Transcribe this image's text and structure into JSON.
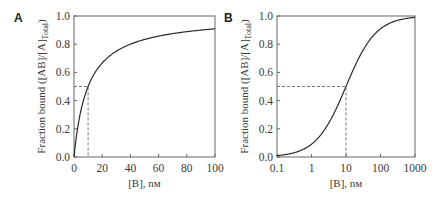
{
  "chart_data": [
    {
      "type": "line",
      "panel": "A",
      "title": "",
      "xlabel": "[B], nм",
      "ylabel": "Fraction bound ([AB]/[A]Total)",
      "xscale": "linear",
      "xlim": [
        0,
        100
      ],
      "ylim": [
        0,
        1.0
      ],
      "x_ticks": [
        "0",
        "20",
        "40",
        "60",
        "80",
        "100"
      ],
      "y_ticks": [
        "0.0",
        "0.2",
        "0.4",
        "0.6",
        "0.8",
        "1.0"
      ],
      "grid": false,
      "legend": null,
      "series": [
        {
          "name": "binding curve",
          "function": "x / (10 + x)",
          "x": [
            0,
            2,
            5,
            10,
            20,
            30,
            40,
            50,
            60,
            70,
            80,
            90,
            100
          ],
          "y": [
            0,
            0.17,
            0.33,
            0.5,
            0.67,
            0.75,
            0.8,
            0.83,
            0.86,
            0.88,
            0.89,
            0.9,
            0.91
          ]
        }
      ],
      "annotations": [
        {
          "type": "dashed-guide",
          "x": 10,
          "y": 0.5,
          "label": "Kd = 10 nM"
        }
      ]
    },
    {
      "type": "line",
      "panel": "B",
      "title": "",
      "xlabel": "[B], nм",
      "ylabel": "Fraction bound ([AB]/[A]Total)",
      "xscale": "log",
      "xlim": [
        0.1,
        1000
      ],
      "ylim": [
        0,
        1.0
      ],
      "x_ticks": [
        "0.1",
        "1",
        "10",
        "100",
        "1000"
      ],
      "y_ticks": [
        "0.0",
        "0.2",
        "0.4",
        "0.6",
        "0.8",
        "1.0"
      ],
      "grid": false,
      "legend": null,
      "series": [
        {
          "name": "binding curve",
          "function": "x / (10 + x)",
          "x": [
            0.1,
            0.3,
            1,
            3,
            10,
            30,
            100,
            300,
            1000
          ],
          "y": [
            0.01,
            0.03,
            0.09,
            0.23,
            0.5,
            0.75,
            0.91,
            0.97,
            0.99
          ]
        }
      ],
      "annotations": [
        {
          "type": "dashed-guide",
          "x": 10,
          "y": 0.5,
          "label": "Kd = 10 nM"
        }
      ]
    }
  ],
  "panels": {
    "a": {
      "letter": "A",
      "xlabel": "[B], nм",
      "ylabel_main": "Fraction bound ([AB]/[A]",
      "ylabel_sub": "Total",
      "ylabel_end": ")",
      "x_ticks": [
        "0",
        "20",
        "40",
        "60",
        "80",
        "100"
      ],
      "y_ticks": [
        "0.0",
        "0.2",
        "0.4",
        "0.6",
        "0.8",
        "1.0"
      ]
    },
    "b": {
      "letter": "B",
      "xlabel": "[B], nм",
      "ylabel_main": "Fraction bound ([AB]/[A]",
      "ylabel_sub": "Total",
      "ylabel_end": ")",
      "x_ticks": [
        "0.1",
        "1",
        "10",
        "100",
        "1000"
      ],
      "y_ticks": [
        "0.0",
        "0.2",
        "0.4",
        "0.6",
        "0.8",
        "1.0"
      ]
    }
  },
  "colors": {
    "axis": "#555555",
    "curve": "#2b2b2b",
    "guide": "#666666"
  }
}
